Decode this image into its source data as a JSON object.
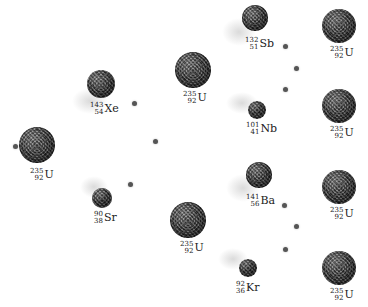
{
  "diagram": {
    "type": "nuclear-fission-chain-reaction",
    "nuclei": [
      {
        "id": "u235-initial",
        "element": "U",
        "mass": "235",
        "atomic": "92",
        "cx": 37,
        "cy": 145,
        "r": 18,
        "lx": 30,
        "ly": 168
      },
      {
        "id": "xe143",
        "element": "Xe",
        "mass": "143",
        "atomic": "54",
        "cx": 101,
        "cy": 84,
        "r": 14,
        "lx": 90,
        "ly": 102,
        "trail": {
          "x": 72,
          "y": 88,
          "w": 36,
          "h": 26
        }
      },
      {
        "id": "sr90",
        "element": "Sr",
        "mass": "90",
        "atomic": "38",
        "cx": 102,
        "cy": 198,
        "r": 10,
        "lx": 94,
        "ly": 211,
        "trail": {
          "x": 80,
          "y": 176,
          "w": 28,
          "h": 22
        }
      },
      {
        "id": "u235-top",
        "element": "U",
        "mass": "235",
        "atomic": "92",
        "cx": 193,
        "cy": 70,
        "r": 18,
        "lx": 183,
        "ly": 91
      },
      {
        "id": "u235-bottom",
        "element": "U",
        "mass": "235",
        "atomic": "92",
        "cx": 188,
        "cy": 220,
        "r": 18,
        "lx": 180,
        "ly": 241
      },
      {
        "id": "sb132",
        "element": "Sb",
        "mass": "132",
        "atomic": "51",
        "cx": 255,
        "cy": 18,
        "r": 13,
        "lx": 245,
        "ly": 37,
        "trail": {
          "x": 222,
          "y": 18,
          "w": 34,
          "h": 28
        }
      },
      {
        "id": "nb101",
        "element": "Nb",
        "mass": "101",
        "atomic": "41",
        "cx": 257,
        "cy": 110,
        "r": 9,
        "lx": 246,
        "ly": 122,
        "trail": {
          "x": 226,
          "y": 92,
          "w": 32,
          "h": 22
        }
      },
      {
        "id": "ba141",
        "element": "Ba",
        "mass": "141",
        "atomic": "56",
        "cx": 259,
        "cy": 175,
        "r": 13,
        "lx": 246,
        "ly": 194,
        "trail": {
          "x": 226,
          "y": 174,
          "w": 34,
          "h": 28
        }
      },
      {
        "id": "kr92",
        "element": "Kr",
        "mass": "92",
        "atomic": "36",
        "cx": 248,
        "cy": 268,
        "r": 9,
        "lx": 236,
        "ly": 281,
        "trail": {
          "x": 218,
          "y": 248,
          "w": 30,
          "h": 22
        }
      },
      {
        "id": "u235-r1",
        "element": "U",
        "mass": "235",
        "atomic": "92",
        "cx": 339,
        "cy": 26,
        "r": 17,
        "lx": 330,
        "ly": 46
      },
      {
        "id": "u235-r2",
        "element": "U",
        "mass": "235",
        "atomic": "92",
        "cx": 339,
        "cy": 106,
        "r": 17,
        "lx": 330,
        "ly": 126
      },
      {
        "id": "u235-r3",
        "element": "U",
        "mass": "235",
        "atomic": "92",
        "cx": 339,
        "cy": 187,
        "r": 17,
        "lx": 330,
        "ly": 207
      },
      {
        "id": "u235-r4",
        "element": "U",
        "mass": "235",
        "atomic": "92",
        "cx": 339,
        "cy": 268,
        "r": 17,
        "lx": 330,
        "ly": 288
      }
    ],
    "neutrons": [
      {
        "x": 15,
        "y": 146
      },
      {
        "x": 134,
        "y": 103
      },
      {
        "x": 155,
        "y": 141
      },
      {
        "x": 130,
        "y": 184
      },
      {
        "x": 285,
        "y": 46
      },
      {
        "x": 296,
        "y": 68
      },
      {
        "x": 285,
        "y": 89
      },
      {
        "x": 284,
        "y": 205
      },
      {
        "x": 296,
        "y": 226
      },
      {
        "x": 285,
        "y": 249
      }
    ]
  }
}
